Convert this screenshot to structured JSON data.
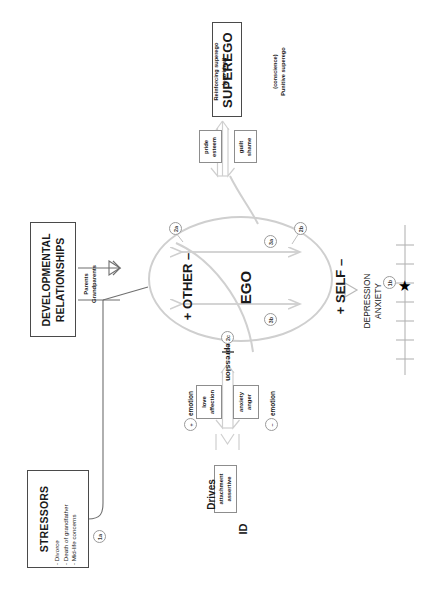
{
  "diagram": {
    "orientation": "rotated-90",
    "colors": {
      "line_gray": "#bdbdbd",
      "box_border": "#4a4a4a",
      "text": "#1a1a1a",
      "star": "#000000",
      "axis": "#b5b5b5"
    }
  },
  "stressors": {
    "title": "STRESSORS",
    "items": [
      "- Divorce",
      "- Death of grandfather",
      "- Mid-life concerns"
    ],
    "marker": "1a"
  },
  "developmental": {
    "title_line1": "DEVELOPMENTAL",
    "title_line2": "RELATIONSHIPS",
    "caption_line1": "Parents",
    "caption_line2": "Grandparents"
  },
  "superego": {
    "title": "SUPEREGO",
    "left_caption_line1": "Reinforcing superego",
    "left_caption_line2": "(ego ideal)",
    "right_caption_line1": "(conscience)",
    "right_caption_line2": "Punitive superego",
    "pride_line1": "pride",
    "pride_line2": "esteem",
    "guilt_line1": "guilt",
    "guilt_line2": "shame"
  },
  "ego": {
    "center_label": "EGO",
    "other_label": "+ OTHER –",
    "self_label": "+ SELF –",
    "repression_label": "repression",
    "markers": {
      "m2a": "2a",
      "m2b": "2b",
      "m2c": "2c",
      "m3a": "3a",
      "m3b": "3b"
    }
  },
  "emotions": {
    "positive_marker": "+",
    "positive_label": "emotion",
    "positive_box_line1": "love",
    "positive_box_line2": "affection",
    "negative_marker": "–",
    "negative_label": "emotion",
    "negative_box_line1": "anxiety",
    "negative_box_line2": "anger"
  },
  "id": {
    "title": "ID",
    "drives_label": "Drives",
    "box_line1": "attachment",
    "box_line2": "assertive"
  },
  "symptoms": {
    "line1": "DEPRESSION",
    "line2": "ANXIETY",
    "marker": "1b",
    "star_glyph": "★"
  }
}
